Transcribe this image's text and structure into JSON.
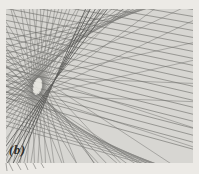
{
  "figure": {
    "label": "(b)",
    "page_background": "#eceae6",
    "background": "#d7d6d2",
    "line_color": "#6d6d6a",
    "bundle_color": "#525250",
    "label_color": "#2e2d2b",
    "frame": {
      "x": 6,
      "y": 9,
      "width": 187,
      "height": 154
    }
  },
  "chart_data": {
    "type": "line",
    "title": "",
    "families": [
      {
        "name": "parallel-field",
        "kind": "sloped-lines",
        "anchor_x": 196,
        "y_start": 10,
        "y_step": 7.0,
        "slope_start": 0.165,
        "slope_step": 0.0055,
        "count": 21,
        "width": 0.75,
        "opacity": 0.8
      },
      {
        "name": "lower-arc-tangents",
        "kind": "bezier-tangents",
        "p0": [
          44,
          97
        ],
        "c": [
          86,
          152
        ],
        "p2": [
          270,
          198
        ],
        "u0": 0.0,
        "u1": 0.9,
        "count": 14,
        "width": 0.7,
        "opacity": 0.75
      },
      {
        "name": "upper-arc-tangents",
        "kind": "bezier-tangents",
        "p0": [
          37,
          78
        ],
        "c": [
          88,
          20
        ],
        "p2": [
          172,
          2
        ],
        "u0": 0.02,
        "u1": 0.98,
        "count": 13,
        "width": 0.7,
        "opacity": 0.75
      },
      {
        "name": "oval-tangent-star",
        "kind": "ellipse-tangents",
        "cx": 37.5,
        "cy": 86.5,
        "rx": 5.2,
        "ry": 9.2,
        "rotation_deg": 12,
        "count": 40,
        "width": 0.65,
        "opacity": 0.7
      },
      {
        "name": "node-bundle",
        "kind": "pencil",
        "pivot": [
          43,
          96
        ],
        "pivot_step": [
          0.7,
          1.1
        ],
        "slopes": [
          -1.35,
          -1.55,
          -1.75,
          -2.0,
          -2.3
        ],
        "width": 0.9,
        "opacity": 0.85,
        "color": "#525250"
      }
    ],
    "hole": {
      "cx": 37.5,
      "cy": 86.5,
      "rx": 3.9,
      "ry": 7.6,
      "rotation_deg": 12,
      "fill": "#e7e5df"
    },
    "edge_stubs": [
      [
        6,
        163,
        7,
        171
      ],
      [
        9,
        163,
        13,
        171
      ],
      [
        17,
        163,
        21,
        170
      ],
      [
        25,
        163,
        28,
        170
      ],
      [
        33,
        163,
        36,
        169
      ],
      [
        41,
        163,
        44,
        168
      ]
    ]
  }
}
